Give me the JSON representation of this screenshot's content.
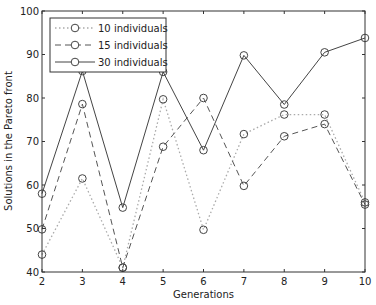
{
  "chart_data": {
    "type": "line",
    "title": "",
    "xlabel": "Generations",
    "ylabel": "Solutions in the Pareto front",
    "xlim": [
      2,
      10
    ],
    "ylim": [
      40,
      100
    ],
    "x": [
      2,
      3,
      4,
      5,
      6,
      7,
      8,
      9,
      10
    ],
    "xticks": [
      2,
      3,
      4,
      5,
      6,
      7,
      8,
      9,
      10
    ],
    "yticks": [
      40,
      50,
      60,
      70,
      80,
      90,
      100
    ],
    "grid": false,
    "legend_position": "upper left",
    "series": [
      {
        "name": "10 individuals",
        "style": "dotted",
        "marker": "circle",
        "color": "#aaaaaa",
        "values": [
          44,
          61.5,
          41,
          79.7,
          49.7,
          71.7,
          76.2,
          76.2,
          56
        ]
      },
      {
        "name": "15 individuals",
        "style": "dashed",
        "marker": "circle",
        "color": "#555555",
        "values": [
          49.8,
          78.6,
          41,
          68.8,
          80,
          59.8,
          71.2,
          74,
          55.5
        ]
      },
      {
        "name": "30 individuals",
        "style": "solid",
        "marker": "circle",
        "color": "#444444",
        "values": [
          58,
          86.2,
          54.8,
          86,
          68,
          89.8,
          78.5,
          90.5,
          93.8
        ]
      }
    ]
  }
}
